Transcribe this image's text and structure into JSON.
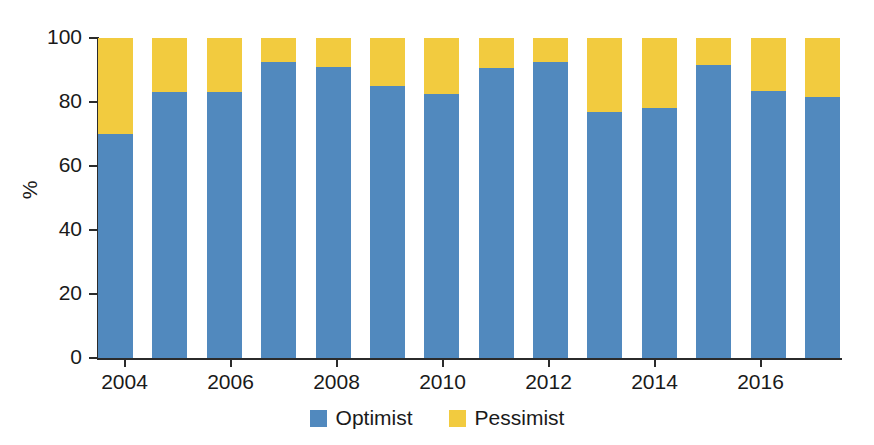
{
  "chart_data": {
    "type": "bar",
    "subtype": "stacked-percentage",
    "title": "",
    "xlabel": "",
    "ylabel": "%",
    "ylim": [
      0,
      100
    ],
    "ytick_values": [
      0,
      20,
      40,
      60,
      80,
      100
    ],
    "ytick_labels": [
      "0",
      "20",
      "40",
      "60",
      "80",
      "100"
    ],
    "grid": false,
    "legend_position": "bottom-center",
    "categories": [
      "2004",
      "2005",
      "2006",
      "2007",
      "2008",
      "2009",
      "2010",
      "2011",
      "2012",
      "2013",
      "2014",
      "2015",
      "2016",
      "2017"
    ],
    "xtick_labels": [
      "2004",
      "2006",
      "2008",
      "2010",
      "2012",
      "2014",
      "2016"
    ],
    "xtick_categories": [
      "2004",
      "2006",
      "2008",
      "2010",
      "2012",
      "2014",
      "2016"
    ],
    "series": [
      {
        "name": "Optimist",
        "color": "#5189be",
        "values": [
          70,
          83,
          83,
          92.5,
          91,
          85,
          82.5,
          90.5,
          92.5,
          77,
          78,
          91.5,
          83.5,
          81.5
        ]
      },
      {
        "name": "Pessimist",
        "color": "#f2cb3f",
        "values": [
          30,
          17,
          17,
          7.5,
          9,
          15,
          17.5,
          9.5,
          7.5,
          23,
          22,
          8.5,
          16.5,
          18.5
        ]
      }
    ]
  },
  "legend": {
    "items": [
      {
        "label": "Optimist",
        "color": "#5189be"
      },
      {
        "label": "Pessimist",
        "color": "#f2cb3f"
      }
    ]
  },
  "axes": {
    "y_title": "%"
  }
}
